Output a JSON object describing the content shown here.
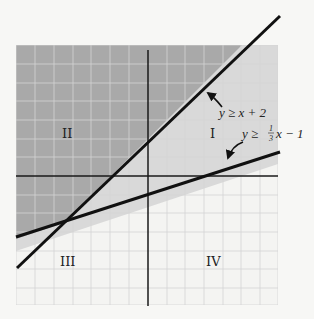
{
  "figure": {
    "type": "system-of-inequalities-graph",
    "grid": {
      "x_range": [
        -7,
        7
      ],
      "y_range": [
        -7,
        7
      ],
      "step": 1
    },
    "colors": {
      "background": "#f7f7f5",
      "grid_line": "#d6d6d6",
      "both_region": "#a9a9a9",
      "one_region": "#d9d9d9",
      "axis": "#1a1a1a",
      "boundary": "#111111"
    },
    "quadrant_labels": {
      "q1": "I",
      "q2": "II",
      "q3": "III",
      "q4": "IV"
    },
    "inequalities": [
      {
        "id": "ineq1",
        "label": "y ≥ x + 2",
        "slope": 1,
        "intercept": 2
      },
      {
        "id": "ineq2",
        "label_prefix": "y ≥ ",
        "frac_num": "1",
        "frac_den": "3",
        "label_suffix": "x − 1",
        "slope": 0.3333,
        "intercept": -1
      }
    ],
    "arrows": [
      {
        "points_to": "ineq1"
      },
      {
        "points_to": "ineq2"
      }
    ]
  }
}
